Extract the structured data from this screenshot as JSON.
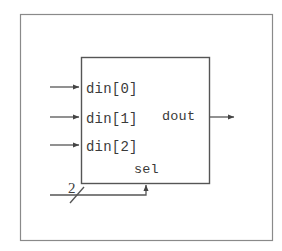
{
  "figure": {
    "background_color": "#ffffff",
    "line_color": "#555555",
    "text_color": "#3a3a3a",
    "frame": {
      "x": 20,
      "y": 14,
      "width": 252,
      "height": 226,
      "stroke": "#8a8a8a"
    },
    "block": {
      "name": "mux-block",
      "x": 81,
      "y": 57,
      "width": 128,
      "height": 126,
      "stroke": "#555555"
    }
  },
  "inputs": [
    {
      "label": "din[0]",
      "y": 87,
      "line_x1": 50,
      "line_x2": 81,
      "text_x": 86,
      "text_y": 93
    },
    {
      "label": "din[1]",
      "y": 117,
      "line_x1": 50,
      "line_x2": 81,
      "text_x": 86,
      "text_y": 123
    },
    {
      "label": "din[2]",
      "y": 145,
      "line_x1": 50,
      "line_x2": 81,
      "text_x": 86,
      "text_y": 151
    }
  ],
  "output": {
    "label": "dout",
    "y": 117,
    "line_x1": 209,
    "line_x2": 236,
    "text_x": 162,
    "text_y": 120
  },
  "select": {
    "label": "sel",
    "text_x": 134,
    "text_y": 173,
    "bus_width_label": "2",
    "bus_width_text_x": 68,
    "bus_width_text_y": 193,
    "bus_line_y": 195,
    "bus_line_x1": 50,
    "bus_corner_x": 146,
    "arrow_tip_y": 183,
    "slash_x1": 70,
    "slash_y1": 203,
    "slash_x2": 84,
    "slash_y2": 187
  }
}
